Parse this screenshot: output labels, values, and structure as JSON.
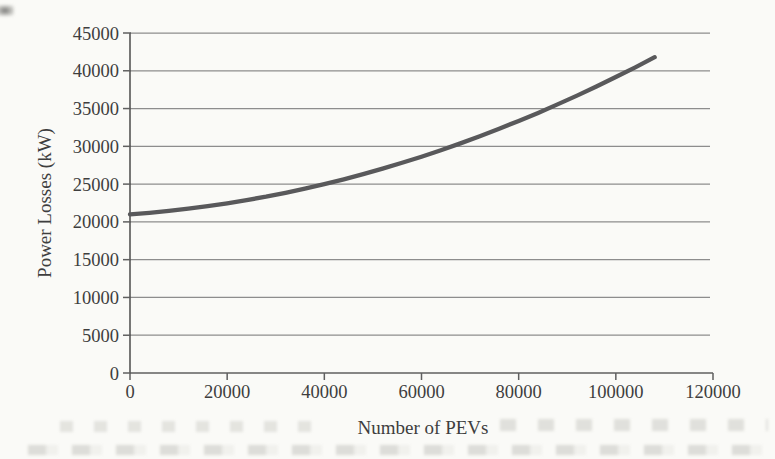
{
  "figure": {
    "background_color": "#fafaf7",
    "text_color": "#3e3e3e",
    "gridline_color": "#8d8d8d",
    "axis_color": "#5f5f5f"
  },
  "chart_data": {
    "type": "line",
    "title": "",
    "xlabel": "Number of PEVs",
    "ylabel": "Power Losses (kW)",
    "xlim": [
      0,
      120000
    ],
    "ylim": [
      0,
      45000
    ],
    "x_ticks": [
      0,
      20000,
      40000,
      60000,
      80000,
      100000,
      120000
    ],
    "y_ticks": [
      0,
      5000,
      10000,
      15000,
      20000,
      25000,
      30000,
      35000,
      40000,
      45000
    ],
    "grid": "horizontal",
    "legend": "none",
    "series": [
      {
        "name": "Power losses",
        "color": "#59595b",
        "x": [
          0,
          4000,
          8000,
          12000,
          16000,
          20000,
          24000,
          28000,
          32000,
          36000,
          40000,
          44000,
          48000,
          52000,
          56000,
          60000,
          64000,
          68000,
          72000,
          76000,
          80000,
          84000,
          88000,
          92000,
          96000,
          100000,
          104000,
          108000
        ],
        "y": [
          21000,
          21200,
          21450,
          21740,
          22080,
          22460,
          22880,
          23340,
          23850,
          24400,
          25000,
          25640,
          26320,
          27050,
          27820,
          28630,
          29490,
          30390,
          31340,
          32330,
          33360,
          34430,
          35550,
          36710,
          37920,
          39170,
          40460,
          41800
        ]
      }
    ]
  }
}
